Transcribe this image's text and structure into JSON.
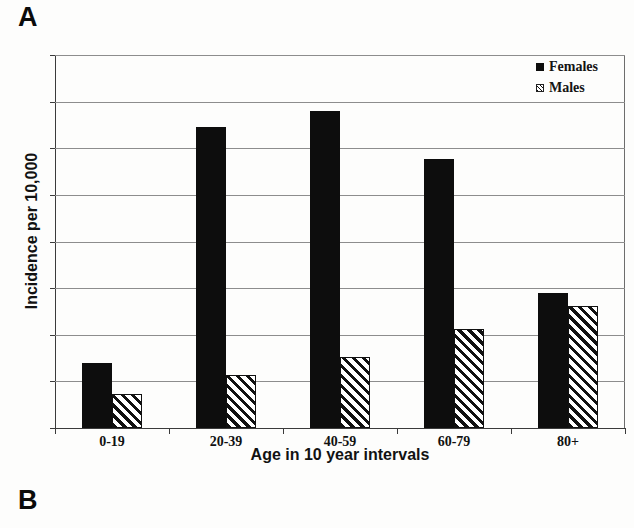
{
  "figure": {
    "panel_a_label": "A",
    "panel_b_label": "B"
  },
  "chart_data": {
    "type": "bar",
    "title": "",
    "xlabel": "Age in 10 year intervals",
    "ylabel": "Incidence per 10,000",
    "categories": [
      "0-19",
      "20-39",
      "40-59",
      "60-79",
      "80+"
    ],
    "series": [
      {
        "name": "Females",
        "pattern": "solid",
        "color": "#0d0d0d",
        "values": [
          14.0,
          64.5,
          68.0,
          57.8,
          29.0
        ]
      },
      {
        "name": "Males",
        "pattern": "diagonal-hatch",
        "color": "#111111",
        "values": [
          7.2,
          11.3,
          15.2,
          21.3,
          26.2
        ]
      }
    ],
    "ylim": [
      0,
      80
    ],
    "yticks": [
      0,
      10,
      20,
      30,
      40,
      50,
      60,
      70,
      80
    ],
    "ytick_labels": [
      "0",
      "10",
      "20",
      "30",
      "40",
      "50",
      "60",
      "70",
      "80"
    ],
    "grid": true,
    "grid_axis": "y",
    "legend_position": "top-right",
    "legend": [
      "Females",
      "Males"
    ]
  }
}
